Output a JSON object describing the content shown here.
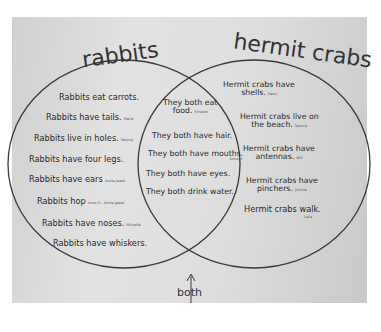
{
  "diagram": {
    "type": "venn",
    "left_set": {
      "title": "rabbits",
      "items": [
        {
          "text": "Rabbits eat carrots.",
          "author": ""
        },
        {
          "text": "Rabbits have tails.",
          "author": "Marie"
        },
        {
          "text": "Rabbits live in holes.",
          "author": "Tammy"
        },
        {
          "text": "Rabbits have four legs.",
          "author": ""
        },
        {
          "text": "Rabbits have ears",
          "author": "Annie-Jewel"
        },
        {
          "text": "Rabbits hop",
          "author": "Anna H., Annie-Jewel"
        },
        {
          "text": "Rabbits have noses.",
          "author": "Michelle"
        },
        {
          "text": "Rabbits have whiskers.",
          "author": ""
        }
      ]
    },
    "right_set": {
      "title": "hermit crabs",
      "items": [
        {
          "line1": "Hermit crabs have",
          "line2": "shells.",
          "author": "Hans"
        },
        {
          "line1": "Hermit crabs live on",
          "line2": "the beach.",
          "author": "Tammy"
        },
        {
          "line1": "Hermit crabs have",
          "line2": "antennas.",
          "author": "Will"
        },
        {
          "line1": "Hermit crabs have",
          "line2": "pinchers.",
          "author": "Jimmie"
        },
        {
          "line1": "Hermit crabs walk.",
          "line2": "",
          "author": "Leila"
        }
      ]
    },
    "intersection": {
      "label": "both",
      "items": [
        {
          "line1": "They both eat",
          "line2": "food.",
          "author": "Ernesto"
        },
        {
          "line1": "They both have hair.",
          "line2": "",
          "author": ""
        },
        {
          "line1": "They both have mouths.",
          "line2": "",
          "author": "Anna H."
        },
        {
          "line1": "They both have eyes.",
          "line2": "",
          "author": ""
        },
        {
          "line1": "They both drink water.",
          "line2": "",
          "author": ""
        }
      ]
    },
    "colors": {
      "paper": "#dcdcdc",
      "ink": "#2a2a2a",
      "line": "#3a3a3a"
    }
  }
}
